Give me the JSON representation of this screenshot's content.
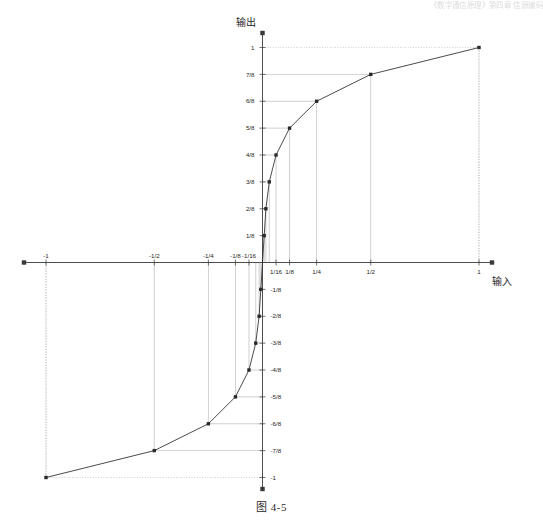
{
  "page": {
    "header_faint_text": "《数字通信原理》第四章  信源编码",
    "caption": "图 4-5"
  },
  "axes": {
    "y_label": "输出",
    "x_label": "输入",
    "x_ticks": [
      {
        "label": "-1",
        "value": -1
      },
      {
        "label": "-1/2",
        "value": -0.5
      },
      {
        "label": "-1/4",
        "value": -0.25
      },
      {
        "label": "-1/8",
        "value": -0.125
      },
      {
        "label": "-1/16",
        "value": -0.0625
      },
      {
        "label": "1/16",
        "value": 0.0625
      },
      {
        "label": "1/8",
        "value": 0.125
      },
      {
        "label": "1/4",
        "value": 0.25
      },
      {
        "label": "1/2",
        "value": 0.5
      },
      {
        "label": "1",
        "value": 1
      }
    ],
    "y_ticks": [
      {
        "label": "1",
        "value": 1
      },
      {
        "label": "7/8",
        "value": 0.875
      },
      {
        "label": "6/8",
        "value": 0.75
      },
      {
        "label": "5/8",
        "value": 0.625
      },
      {
        "label": "4/8",
        "value": 0.5
      },
      {
        "label": "3/8",
        "value": 0.375
      },
      {
        "label": "2/8",
        "value": 0.25
      },
      {
        "label": "1/8",
        "value": 0.125
      },
      {
        "label": "-1/8",
        "value": -0.125
      },
      {
        "label": "-2/8",
        "value": -0.25
      },
      {
        "label": "-3/8",
        "value": -0.375
      },
      {
        "label": "-4/8",
        "value": -0.5
      },
      {
        "label": "-5/8",
        "value": -0.625
      },
      {
        "label": "-6/8",
        "value": -0.75
      },
      {
        "label": "-7/8",
        "value": -0.875
      },
      {
        "label": "-1",
        "value": -1
      }
    ]
  },
  "chart_data": {
    "type": "line",
    "title": "图 4-5",
    "xlabel": "输入",
    "ylabel": "输出",
    "xlim": [
      -1,
      1
    ],
    "ylim": [
      -1,
      1
    ],
    "grid": "dotted-guide-lines",
    "legend": "none",
    "markers": "square",
    "x": [
      -1,
      -0.5,
      -0.25,
      -0.125,
      -0.0625,
      -0.03125,
      -0.015625,
      -0.0078125,
      0,
      0.0078125,
      0.015625,
      0.03125,
      0.0625,
      0.125,
      0.25,
      0.5,
      1
    ],
    "y": [
      -1,
      -0.875,
      -0.75,
      -0.625,
      -0.5,
      -0.375,
      -0.25,
      -0.125,
      0,
      0.125,
      0.25,
      0.375,
      0.5,
      0.625,
      0.75,
      0.875,
      1
    ],
    "points": [
      {
        "x": -1,
        "y": -1,
        "x_label": "-1",
        "y_label": "-1"
      },
      {
        "x": -0.5,
        "y": -0.875,
        "x_label": "-1/2",
        "y_label": "-7/8"
      },
      {
        "x": -0.25,
        "y": -0.75,
        "x_label": "-1/4",
        "y_label": "-6/8"
      },
      {
        "x": -0.125,
        "y": -0.625,
        "x_label": "-1/8",
        "y_label": "-5/8"
      },
      {
        "x": -0.0625,
        "y": -0.5,
        "x_label": "-1/16",
        "y_label": "-4/8"
      },
      {
        "x": -0.03125,
        "y": -0.375,
        "x_label": "-1/32",
        "y_label": "-3/8"
      },
      {
        "x": -0.015625,
        "y": -0.25,
        "x_label": "-1/64",
        "y_label": "-2/8"
      },
      {
        "x": -0.0078125,
        "y": -0.125,
        "x_label": "-1/128",
        "y_label": "-1/8"
      },
      {
        "x": 0,
        "y": 0,
        "x_label": "0",
        "y_label": "0"
      },
      {
        "x": 0.0078125,
        "y": 0.125,
        "x_label": "1/128",
        "y_label": "1/8"
      },
      {
        "x": 0.015625,
        "y": 0.25,
        "x_label": "1/64",
        "y_label": "2/8"
      },
      {
        "x": 0.03125,
        "y": 0.375,
        "x_label": "1/32",
        "y_label": "3/8"
      },
      {
        "x": 0.0625,
        "y": 0.5,
        "x_label": "1/16",
        "y_label": "4/8"
      },
      {
        "x": 0.125,
        "y": 0.625,
        "x_label": "1/8",
        "y_label": "5/8"
      },
      {
        "x": 0.25,
        "y": 0.75,
        "x_label": "1/4",
        "y_label": "6/8"
      },
      {
        "x": 0.5,
        "y": 0.875,
        "x_label": "1/2",
        "y_label": "7/8"
      },
      {
        "x": 1,
        "y": 1,
        "x_label": "1",
        "y_label": "1"
      }
    ]
  },
  "colors": {
    "curve": "#2a2a2a",
    "axis": "#3a3a3a",
    "guide": "#8a8a8a",
    "text": "#262626",
    "background": "#ffffff"
  }
}
